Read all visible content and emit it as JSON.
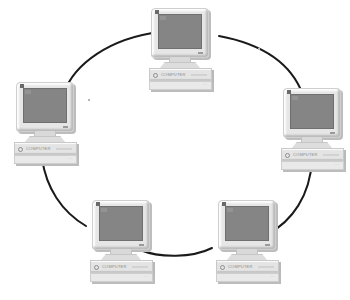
{
  "diagram": {
    "type": "ring-network-topology",
    "canvas": {
      "width": 350,
      "height": 300,
      "background": "#ffffff"
    },
    "colors": {
      "background": "#ffffff",
      "link": "#1a1a1a",
      "monitor_case": "#e6e6e6",
      "screen": "#858585",
      "drop_shadow": "#bdbdbd",
      "label_text": "#8a8a8a"
    },
    "link": {
      "color": "#1a1a1a",
      "width_px": 2,
      "style": "solid-curved-arc"
    },
    "ring": {
      "center_x": 178,
      "center_y": 150,
      "radius_x": 132,
      "radius_y": 118
    }
  },
  "nodes": [
    {
      "id": "pc-top",
      "label": "",
      "position": "top",
      "x": 147,
      "y": 8,
      "screen_color": "#858585",
      "base_label": "COMPUTER",
      "tray_mark": "···"
    },
    {
      "id": "pc-left",
      "label": "",
      "position": "left",
      "x": 12,
      "y": 82,
      "screen_color": "#858585",
      "base_label": "COMPUTER",
      "tray_mark": "···"
    },
    {
      "id": "pc-right",
      "label": "",
      "position": "right",
      "x": 279,
      "y": 88,
      "screen_color": "#858585",
      "base_label": "COMPUTER",
      "tray_mark": "···"
    },
    {
      "id": "pc-bottom-left",
      "label": "",
      "position": "bottom-left",
      "x": 88,
      "y": 200,
      "screen_color": "#858585",
      "base_label": "COMPUTER",
      "tray_mark": "···"
    },
    {
      "id": "pc-bottom-right",
      "label": "",
      "position": "bottom-right",
      "x": 214,
      "y": 200,
      "screen_color": "#858585",
      "base_label": "COMPUTER",
      "tray_mark": "···"
    }
  ],
  "links": [
    {
      "id": "link-left-top",
      "from": "pc-left",
      "to": "pc-top",
      "path": "M 64 93 C 74 64, 110 38, 160 32"
    },
    {
      "id": "link-top-right",
      "from": "pc-top",
      "to": "pc-right",
      "path": "M 219 36 C 262 44, 291 62, 303 95"
    },
    {
      "id": "link-right-bottomright",
      "from": "pc-right",
      "to": "pc-bottom-right",
      "path": "M 312 160 C 310 196, 292 221, 268 234"
    },
    {
      "id": "link-bottomright-bottomleft",
      "from": "pc-bottom-right",
      "to": "pc-bottom-left",
      "path": "M 212 248 C 192 258, 160 258, 140 250"
    },
    {
      "id": "link-bottomleft-left",
      "from": "pc-bottom-left",
      "to": "pc-left",
      "path": "M 86 226 C 62 212, 46 188, 42 158"
    }
  ],
  "specks": [
    {
      "id": "speck-upper-left",
      "x": 88,
      "y": 99
    },
    {
      "id": "speck-upper-right",
      "x": 258,
      "y": 48
    }
  ]
}
